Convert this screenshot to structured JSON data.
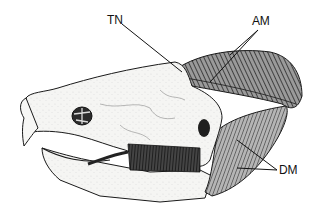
{
  "figure": {
    "labels": [
      {
        "id": "tn",
        "text": "TN"
      },
      {
        "id": "am",
        "text": "AM"
      },
      {
        "id": "dm",
        "text": "DM"
      }
    ],
    "colors": {
      "background": "#ffffff",
      "ink": "#1a1a1a",
      "bone": "#f4f4f2",
      "bone_shade": "#cfcfcb",
      "muscle_dark": "#3a3a3a",
      "muscle_mid": "#7a7a7a"
    }
  }
}
